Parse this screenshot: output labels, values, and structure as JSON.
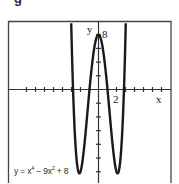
{
  "figure_label": "g",
  "chart_data": {
    "type": "line",
    "title": "",
    "equation": "y = x⁴ − 9x² + 8",
    "equation_parts": {
      "prefix": "y = x",
      "exp1": "4",
      "mid": " − 9x",
      "exp2": "2",
      "suffix": " + 8"
    },
    "function": "x^4 - 9x^2 + 8",
    "xlabel": "x",
    "ylabel": "y",
    "x_tick_label": "2",
    "y_tick_label": "8",
    "xlim": [
      -10,
      8
    ],
    "ylim": [
      -13.5,
      10
    ],
    "x_tick_step": 1,
    "y_tick_step": 2,
    "x_ticks": [
      -8,
      -7,
      -6,
      -5,
      -4,
      -3,
      -2,
      -1,
      1,
      2,
      3,
      4,
      5,
      6,
      7
    ],
    "y_ticks": [
      -12,
      -10,
      -8,
      -6,
      -4,
      -2,
      2,
      4,
      6,
      8
    ],
    "grid": false,
    "key_points": [
      {
        "label": "local max",
        "x": 0,
        "y": 8
      },
      {
        "label": "min",
        "x": -2.12,
        "y": -12.25
      },
      {
        "label": "min",
        "x": 2.12,
        "y": -12.25
      },
      {
        "label": "root",
        "x": -2.83,
        "y": 0
      },
      {
        "label": "root",
        "x": -1,
        "y": 0
      },
      {
        "label": "root",
        "x": 1,
        "y": 0
      },
      {
        "label": "root",
        "x": 2.83,
        "y": 0
      }
    ],
    "colors": {
      "curve": "#1a1a1a",
      "axes": "#333333",
      "frame": "#444444"
    }
  }
}
